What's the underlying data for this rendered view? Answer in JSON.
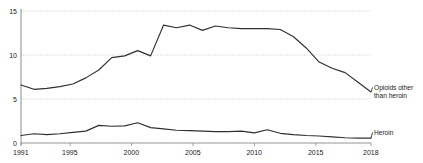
{
  "chart_data": {
    "type": "line",
    "title": "",
    "subtitle": "",
    "xlabel": "",
    "ylabel": "",
    "xlim": [
      1991,
      2018
    ],
    "ylim": [
      0,
      15
    ],
    "grid": true,
    "grid_axis": "y",
    "legend_position": "right-inline",
    "y_ticks": [
      "0",
      "5",
      "10",
      "15"
    ],
    "y_tick_values": [
      0,
      5,
      10,
      15
    ],
    "x_ticks": [
      "1991",
      "1995",
      "2000",
      "2005",
      "2010",
      "2015",
      "2018"
    ],
    "x_tick_values": [
      1991,
      1995,
      2000,
      2005,
      2010,
      2015,
      2018
    ],
    "x": [
      1991,
      1992,
      1993,
      1994,
      1995,
      1996,
      1997,
      1998,
      1999,
      2000,
      2001,
      2002,
      2003,
      2004,
      2005,
      2006,
      2007,
      2008,
      2009,
      2010,
      2011,
      2012,
      2013,
      2014,
      2015,
      2016,
      2017,
      2018
    ],
    "series": [
      {
        "name": "Opioids other than heroin",
        "label_line1": "Opioids other",
        "label_line2": "than heroin",
        "color": "#303030",
        "values": [
          6.6,
          6.1,
          6.2,
          6.4,
          6.7,
          7.4,
          8.3,
          9.7,
          9.9,
          10.5,
          9.9,
          13.4,
          13.1,
          13.4,
          12.8,
          13.3,
          13.1,
          13.0,
          13.0,
          13.0,
          12.9,
          12.1,
          10.8,
          9.2,
          8.5,
          8.0,
          6.9,
          5.8
        ]
      },
      {
        "name": "Heroin",
        "label_line1": "Heroin",
        "label_line2": "",
        "color": "#303030",
        "values": [
          0.85,
          1.05,
          0.95,
          1.05,
          1.2,
          1.35,
          2.0,
          1.9,
          1.95,
          2.3,
          1.75,
          1.6,
          1.45,
          1.4,
          1.35,
          1.3,
          1.3,
          1.35,
          1.15,
          1.5,
          1.1,
          0.95,
          0.85,
          0.8,
          0.7,
          0.6,
          0.55,
          0.55
        ]
      }
    ]
  }
}
